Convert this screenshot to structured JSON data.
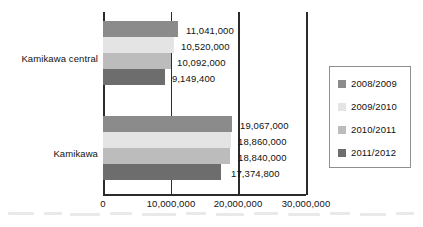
{
  "chart_data": {
    "type": "bar",
    "orientation": "horizontal",
    "title": "",
    "xlabel": "",
    "ylabel": "",
    "xlim": [
      0,
      30000000
    ],
    "grid": false,
    "legend_position": "right",
    "categories": [
      "Kamikawa central",
      "Kamikawa"
    ],
    "xticks": [
      {
        "value": 0,
        "label": "0"
      },
      {
        "value": 10000000,
        "label": "10,000,000"
      },
      {
        "value": 20000000,
        "label": "20,000,000"
      },
      {
        "value": 30000000,
        "label": "30,000,000"
      }
    ],
    "series": [
      {
        "name": "2008/2009",
        "color": "#8b8b8b",
        "values": [
          11041000,
          19067000
        ],
        "labels": [
          "11,041,000",
          "19,067,000"
        ]
      },
      {
        "name": "2009/2010",
        "color": "#e4e4e4",
        "values": [
          10520000,
          18860000
        ],
        "labels": [
          "10,520,000",
          "18,860,000"
        ]
      },
      {
        "name": "2010/2011",
        "color": "#bcbcbc",
        "values": [
          10092000,
          18840000
        ],
        "labels": [
          "10,092,000",
          "18,840,000"
        ]
      },
      {
        "name": "2011/2012",
        "color": "#6d6d6d",
        "values": [
          9149400,
          17374800
        ],
        "labels": [
          "9,149,400",
          "17,374,800"
        ]
      }
    ]
  },
  "legend": {
    "items": [
      {
        "label": "2008/2009"
      },
      {
        "label": "2009/2010"
      },
      {
        "label": "2010/2011"
      },
      {
        "label": "2011/2012"
      }
    ]
  }
}
